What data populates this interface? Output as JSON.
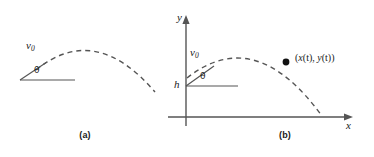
{
  "figure": {
    "background_color": "#ffffff",
    "line_color": "#555555",
    "text_color": "#1a1a1a",
    "width": 374,
    "height": 157
  },
  "panels": [
    {
      "id": "a",
      "caption": "(a)",
      "labels": {
        "velocity": "v",
        "velocity_subscript": "0",
        "angle": "θ"
      },
      "elements": {
        "trajectory": "dashed-parabolic-arc",
        "launch_vector": "solid-line",
        "ground_line": "solid-horizontal-line"
      }
    },
    {
      "id": "b",
      "caption": "(b)",
      "labels": {
        "velocity": "v",
        "velocity_subscript": "0",
        "angle": "θ",
        "height": "h",
        "y_axis": "y",
        "x_axis": "x",
        "point_open": "(",
        "point_x": "x",
        "point_x_arg": "(t)",
        "point_sep": ", ",
        "point_y": "y",
        "point_y_arg": "(t)",
        "point_close": ")",
        "point_full": "(x(t), y(t))"
      },
      "elements": {
        "trajectory": "dashed-parabolic-arc",
        "launch_vector": "solid-line",
        "horizontal_reference": "solid-horizontal-line",
        "y_axis": "vertical-axis-with-arrowhead",
        "x_axis": "horizontal-axis-with-arrowhead",
        "position_marker": "filled-dot"
      }
    }
  ]
}
